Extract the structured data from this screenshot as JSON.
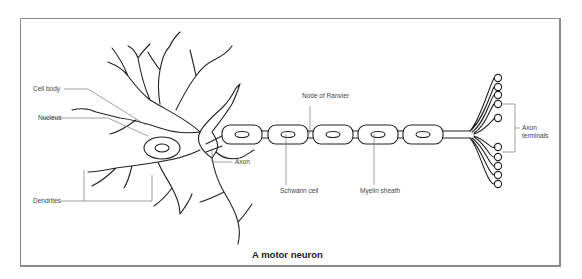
{
  "diagram": {
    "title": "A motor neuron",
    "labels": {
      "cell_body": "Cell body",
      "nucleus": "Nucleus",
      "dendrites": "Dendrites",
      "axon": "Axon",
      "node_of_ranvier": "Node of Ranvier",
      "schwann_cell": "Schwann cell",
      "myelin_sheath": "Myelin sheath",
      "axon_terminals_line1": "Axon",
      "axon_terminals_line2": "terminals"
    },
    "colors": {
      "stroke": "#222222",
      "leader": "#777777",
      "frame": "#8a8a8a",
      "background": "#ffffff"
    }
  }
}
